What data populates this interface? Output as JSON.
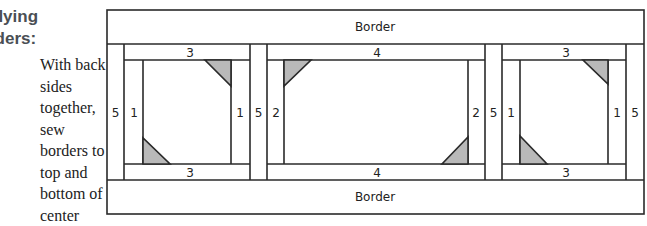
{
  "instructions": {
    "heading_line1": "plying",
    "heading_line2": "rders:",
    "step1": "With back sides together, sew borders to top and bottom of center unit.",
    "step2": "Press the back side;"
  },
  "diagram": {
    "top_border_label": "Border",
    "bottom_border_label": "Border",
    "outer_strip_labels": [
      "5",
      "5",
      "5",
      "5"
    ],
    "block_left": {
      "top": "3",
      "bottom": "3",
      "left": "1",
      "right": "1"
    },
    "block_center": {
      "top": "4",
      "bottom": "4",
      "left": "2",
      "right": "2"
    },
    "block_right": {
      "top": "3",
      "bottom": "3",
      "left": "1",
      "right": "1"
    },
    "colors": {
      "line": "#2a2a2a",
      "triangle_fill": "#b9b9b9"
    }
  }
}
